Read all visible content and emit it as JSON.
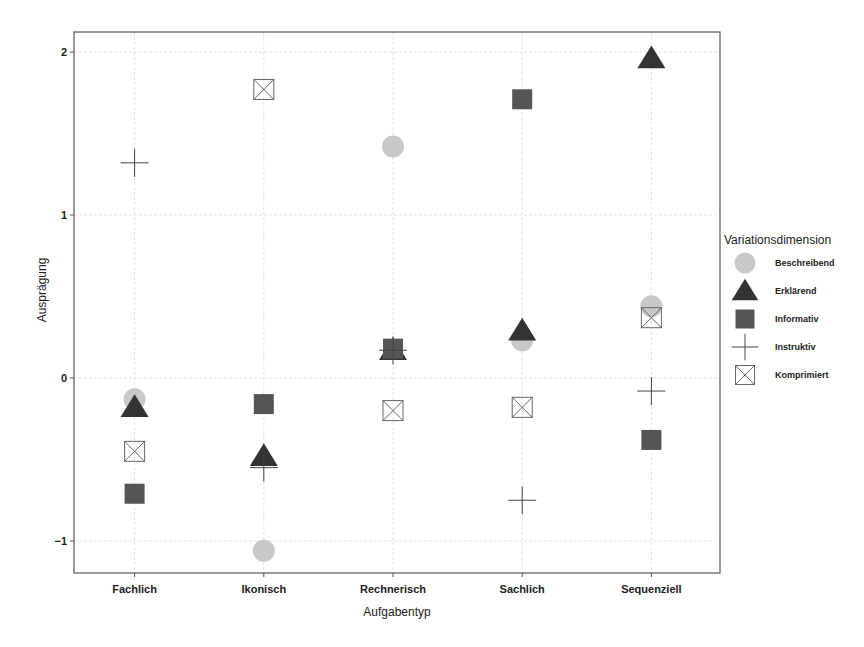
{
  "chart_data": {
    "type": "scatter",
    "title": "",
    "xlabel": "Aufgabentyp",
    "ylabel": "Ausprägung",
    "categories": [
      "Fachlich",
      "Ikonisch",
      "Rechnerisch",
      "Sachlich",
      "Sequenziell"
    ],
    "y_ticks": [
      -1,
      0,
      1,
      2
    ],
    "ylim": [
      -1.2,
      2.1
    ],
    "grid": true,
    "legend": {
      "title": "Variationsdimension",
      "position": "right"
    },
    "series": [
      {
        "name": "Beschreibend",
        "marker": "circle",
        "color": "#c8c8c8",
        "values": [
          -0.13,
          -1.06,
          1.42,
          0.23,
          0.44
        ]
      },
      {
        "name": "Erklärend",
        "marker": "triangle",
        "color": "#333333",
        "values": [
          -0.18,
          -0.48,
          0.17,
          0.29,
          1.96
        ]
      },
      {
        "name": "Informativ",
        "marker": "square",
        "color": "#555555",
        "values": [
          -0.71,
          -0.16,
          0.18,
          1.71,
          -0.38
        ]
      },
      {
        "name": "Instruktiv",
        "marker": "cross",
        "color": "#444444",
        "values": [
          1.32,
          -0.55,
          0.17,
          -0.75,
          -0.08
        ]
      },
      {
        "name": "Komprimiert",
        "marker": "boxed-x",
        "color": "#666666",
        "values": [
          -0.45,
          1.77,
          -0.2,
          -0.18,
          0.37
        ]
      }
    ]
  }
}
